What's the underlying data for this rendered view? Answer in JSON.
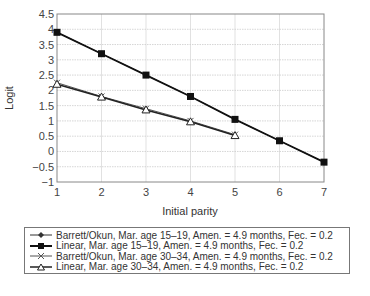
{
  "chart_data": {
    "type": "line",
    "title": "",
    "xlabel": "Initial parity",
    "ylabel": "Logit",
    "x": [
      1,
      2,
      3,
      4,
      5,
      6,
      7
    ],
    "xlim": [
      1,
      7
    ],
    "ylim": [
      -1,
      4.5
    ],
    "xticks": [
      "1",
      "2",
      "3",
      "4",
      "5",
      "6",
      "7"
    ],
    "yticks": [
      "4.5",
      "4",
      "3.5",
      "3",
      "2.5",
      "2",
      "1.5",
      "1",
      "0.5",
      "0",
      "−0.5",
      "−1"
    ],
    "grid": true,
    "legend_position": "below",
    "series": [
      {
        "name": "Barrett/Okun, Mar. age 15–19, Amen. = 4.9 months, Fec. = 0.2",
        "marker": "diamond",
        "x": [
          1,
          2,
          3,
          4,
          5,
          6,
          7
        ],
        "values": [
          3.9,
          3.2,
          2.5,
          1.8,
          1.05,
          0.35,
          -0.35
        ]
      },
      {
        "name": "Linear, Mar. age 15–19, Amen. = 4.9 months, Fec. = 0.2",
        "marker": "square",
        "x": [
          1,
          2,
          3,
          4,
          5,
          6,
          7
        ],
        "values": [
          3.9,
          3.2,
          2.5,
          1.8,
          1.05,
          0.35,
          -0.35
        ]
      },
      {
        "name": "Barrett/Okun, Mar. age 30–34, Amen. = 4.9 months, Fec. = 0.2",
        "marker": "x",
        "x": [
          1,
          2,
          3,
          4,
          5
        ],
        "values": [
          2.25,
          1.8,
          1.4,
          1.0,
          0.55
        ]
      },
      {
        "name": "Linear, Mar. age 30–34, Amen. = 4.9 months, Fec. = 0.2",
        "marker": "triangle",
        "x": [
          1,
          2,
          3,
          4,
          5
        ],
        "values": [
          2.2,
          1.78,
          1.36,
          0.97,
          0.52
        ]
      }
    ]
  },
  "legend": {
    "items": [
      "Barrett/Okun, Mar. age 15–19, Amen. = 4.9 months, Fec. = 0.2",
      "Linear, Mar. age 15–19, Amen. = 4.9 months, Fec. = 0.2",
      "Barrett/Okun, Mar. age 30–34, Amen. = 4.9 months, Fec. = 0.2",
      "Linear, Mar. age 30–34, Amen. = 4.9 months, Fec. = 0.2"
    ]
  }
}
